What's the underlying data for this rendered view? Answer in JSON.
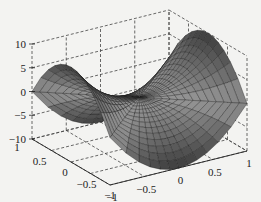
{
  "chart_data": {
    "type": "surface3d",
    "title": "",
    "xlabel": "",
    "ylabel": "",
    "zlabel": "",
    "xlim": [
      -1,
      1
    ],
    "ylim": [
      -1,
      1
    ],
    "zlim": [
      -10,
      10
    ],
    "x_ticks": [
      "-1",
      "-0.5",
      "0",
      "0.5",
      "1"
    ],
    "y_ticks": [
      "1",
      "0.5",
      "0",
      "-0.5",
      "-1"
    ],
    "z_ticks": [
      "10",
      "5",
      "0",
      "-5",
      "-10"
    ],
    "grid": true,
    "mesh": "polar",
    "surface": {
      "function": "z = 10*(x^2 - y^2)",
      "corner_values": {
        "(1,1)": 0,
        "(-1,-1)": 0,
        "(1,0)": 10,
        "(0,1)": -10,
        "(-1,0)": 10,
        "(0,-1)": -10,
        "(0,0)": 0
      }
    }
  },
  "axis_labels": {
    "z": [
      "10",
      "5",
      "0",
      "-5",
      "-10"
    ],
    "y": [
      "1",
      "0.5",
      "0",
      "-0.5",
      "-1"
    ],
    "x": [
      "-1",
      "-0.5",
      "0",
      "0.5",
      "1"
    ]
  }
}
